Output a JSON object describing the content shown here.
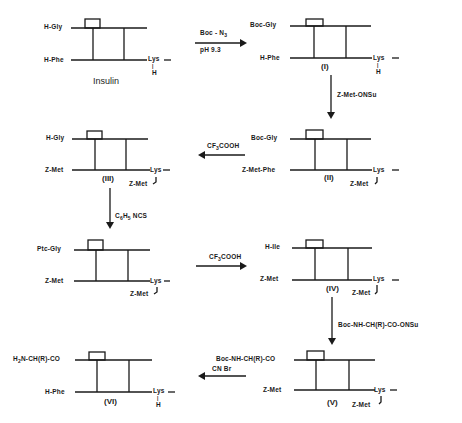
{
  "diagram": {
    "structures": [
      {
        "id": "insulin",
        "top_label": "H-Gly",
        "bottom_label": "H-Phe",
        "lys_label": "Lys",
        "lys_sub": "H",
        "caption": "Insulin"
      },
      {
        "id": "I",
        "top_label": "Boc-Gly",
        "bottom_label": "H-Phe",
        "lys_label": "Lys",
        "lys_sub": "H",
        "caption": "(I)"
      },
      {
        "id": "II",
        "top_label": "Boc-Gly",
        "bottom_label": "Z-Met-Phe",
        "lys_label": "Lys",
        "lys_sub": "Z-Met",
        "caption": "(II)"
      },
      {
        "id": "III",
        "top_label": "H-Gly",
        "bottom_label": "Z-Met",
        "lys_label": "Lys",
        "lys_sub": "Z-Met",
        "caption": "(III)"
      },
      {
        "id": "ptc",
        "top_label": "Ptc-Gly",
        "bottom_label": "Z-Met",
        "lys_label": "Lys",
        "lys_sub": "Z-Met",
        "caption": ""
      },
      {
        "id": "IV",
        "top_label": "H-Ile",
        "bottom_label": "Z-Met",
        "lys_label": "Lys",
        "lys_sub": "Z-Met",
        "caption": "(IV)"
      },
      {
        "id": "V",
        "top_label": "Boc-NH-CH(R)-CO",
        "bottom_label": "Z-Met",
        "lys_label": "Lys",
        "lys_sub": "Z-Met",
        "caption": "(V)"
      },
      {
        "id": "VI",
        "top_label": "H2N-CH(R)-CO",
        "bottom_label": "H-Phe",
        "lys_label": "Lys",
        "lys_sub": "H",
        "caption": "(VI)"
      }
    ],
    "reactions": [
      {
        "from": "insulin",
        "to": "I",
        "reagent": "Boc-N3",
        "condition": "pH 9.3",
        "direction": "right"
      },
      {
        "from": "I",
        "to": "II",
        "reagent": "Z-Met-ONSu",
        "direction": "down"
      },
      {
        "from": "II",
        "to": "III",
        "reagent": "CF3COOH",
        "direction": "left"
      },
      {
        "from": "III",
        "to": "ptc",
        "reagent": "C6H5NCS",
        "direction": "down"
      },
      {
        "from": "ptc",
        "to": "IV",
        "reagent": "CF3COOH",
        "direction": "right"
      },
      {
        "from": "IV",
        "to": "V",
        "reagent": "Boc-NH-CH(R)-CO-ONSu",
        "direction": "down"
      },
      {
        "from": "V",
        "to": "VI",
        "reagent": "CNBr",
        "direction": "left"
      }
    ]
  },
  "labels": {
    "dash": "—",
    "pH": "pH 9.3",
    "boc_n3_main": "Boc - N",
    "boc_n3_sub": "3",
    "zmet_onsu": "Z-Met-ONSu",
    "cf3_a": "CF",
    "cf3_sub": "3",
    "cf3_b": "COOH",
    "c6h5_c": "C",
    "c6h5_6": "6",
    "c6h5_h": "H",
    "c6h5_5": "5",
    "c6h5_ncs": " NCS",
    "boc_onsu": "Boc-NH-CH(R)-CO-ONSu",
    "cnbr": "CN Br",
    "h2n_h": "H",
    "h2n_2": "2",
    "h2n_rest": "N-CH(R)-CO"
  }
}
